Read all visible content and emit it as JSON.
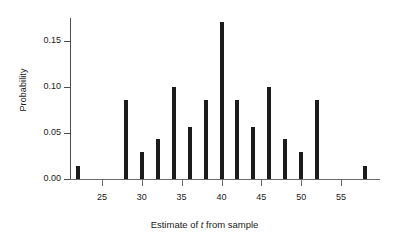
{
  "chart_data": {
    "type": "bar",
    "title": "",
    "subtitle": "",
    "xlabel_prefix": "Estimate of ",
    "xlabel_symbol": "t",
    "xlabel_suffix": " from sample",
    "xlabel": "Estimate of t from sample",
    "ylabel": "Probability",
    "xlim": [
      21,
      59
    ],
    "ylim": [
      0.0,
      0.175
    ],
    "xticks": [
      25,
      30,
      35,
      40,
      45,
      50,
      55
    ],
    "xtick_labels": [
      "25",
      "30",
      "35",
      "40",
      "45",
      "50",
      "55"
    ],
    "yticks": [
      0.0,
      0.05,
      0.1,
      0.15
    ],
    "ytick_labels": [
      "0.00",
      "0.05",
      "0.10",
      "0.15"
    ],
    "grid": false,
    "legend": null,
    "bar_color": "#1c1c1c",
    "axis_color": "#4d4d4d",
    "x": [
      22,
      28,
      30,
      32,
      34,
      36,
      38,
      40,
      42,
      44,
      46,
      48,
      50,
      52,
      58
    ],
    "values": [
      0.014,
      0.086,
      0.029,
      0.043,
      0.1,
      0.057,
      0.086,
      0.171,
      0.086,
      0.057,
      0.1,
      0.043,
      0.029,
      0.086,
      0.014
    ],
    "categories": [
      "22",
      "28",
      "30",
      "32",
      "34",
      "36",
      "38",
      "40",
      "42",
      "44",
      "46",
      "48",
      "50",
      "52",
      "58"
    ],
    "series": [
      {
        "name": "Probability",
        "values": [
          0.014,
          0.086,
          0.029,
          0.043,
          0.1,
          0.057,
          0.086,
          0.171,
          0.086,
          0.057,
          0.1,
          0.043,
          0.029,
          0.086,
          0.014
        ]
      }
    ]
  }
}
